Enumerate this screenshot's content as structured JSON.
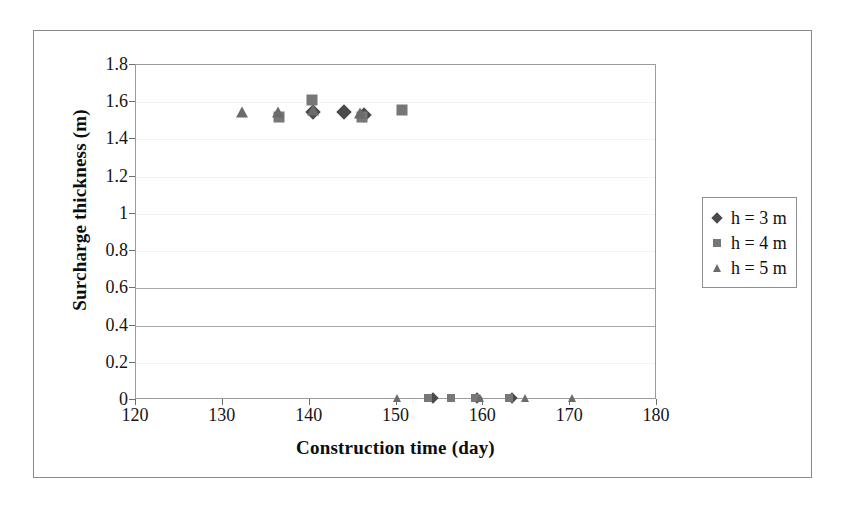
{
  "chart_data": {
    "type": "scatter",
    "title": "",
    "xlabel": "Construction time (day)",
    "ylabel": "Surcharge thickness (m)",
    "xlim": [
      120,
      180
    ],
    "ylim": [
      0,
      1.8
    ],
    "xticks": [
      "120",
      "130",
      "140",
      "150",
      "160",
      "170",
      "180"
    ],
    "yticks": [
      "0",
      "0.2",
      "0.4",
      "0.6",
      "0.8",
      "1",
      "1.2",
      "1.4",
      "1.6",
      "1.8"
    ],
    "grid": true,
    "legend_position": "right",
    "series": [
      {
        "name": "h = 3 m",
        "marker": "diamond",
        "color": "#4a4a4a",
        "points": [
          {
            "x": 140.4,
            "y": 1.55
          },
          {
            "x": 144.0,
            "y": 1.55
          },
          {
            "x": 146.2,
            "y": 1.53
          },
          {
            "x": 154.2,
            "y": 0.01
          },
          {
            "x": 159.3,
            "y": 0.01
          },
          {
            "x": 163.3,
            "y": 0.01
          }
        ]
      },
      {
        "name": "h = 4 m",
        "marker": "square",
        "color": "#777777",
        "points": [
          {
            "x": 136.5,
            "y": 1.52
          },
          {
            "x": 140.3,
            "y": 1.61
          },
          {
            "x": 146.0,
            "y": 1.52
          },
          {
            "x": 150.6,
            "y": 1.56
          },
          {
            "x": 153.6,
            "y": 0.01
          },
          {
            "x": 156.3,
            "y": 0.01
          },
          {
            "x": 159.0,
            "y": 0.01
          },
          {
            "x": 163.0,
            "y": 0.01
          }
        ]
      },
      {
        "name": "h = 5 m",
        "marker": "triangle",
        "color": "#6b6b6b",
        "points": [
          {
            "x": 132.2,
            "y": 1.545
          },
          {
            "x": 136.4,
            "y": 1.545
          },
          {
            "x": 140.4,
            "y": 1.56
          },
          {
            "x": 145.8,
            "y": 1.54
          },
          {
            "x": 150.0,
            "y": 0.01
          },
          {
            "x": 159.6,
            "y": 0.01
          },
          {
            "x": 164.8,
            "y": 0.01
          },
          {
            "x": 170.2,
            "y": 0.01
          }
        ]
      }
    ]
  },
  "legend": {
    "items": [
      {
        "label": "h = 3 m",
        "marker": "diamond"
      },
      {
        "label": "h = 4 m",
        "marker": "square"
      },
      {
        "label": "h = 5 m",
        "marker": "triangle"
      }
    ]
  }
}
